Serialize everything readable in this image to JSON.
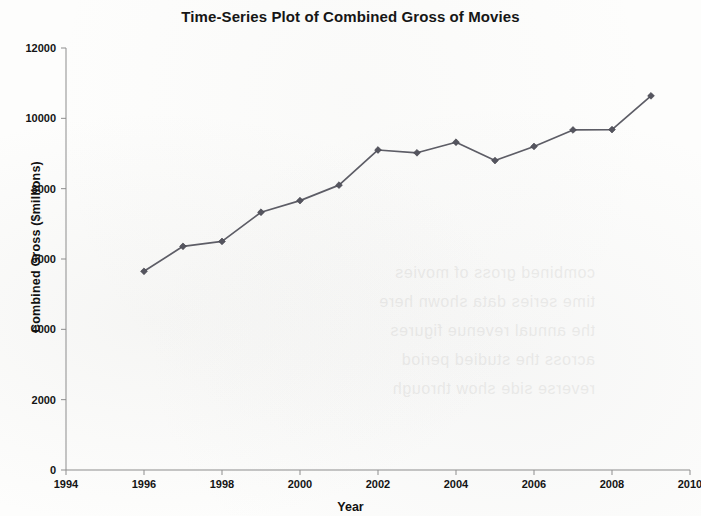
{
  "chart_data": {
    "type": "line",
    "title": "Time-Series Plot of Combined Gross of Movies",
    "xlabel": "Year",
    "ylabel": "Combined Gross ($millions)",
    "xlim": [
      1994,
      2010
    ],
    "ylim": [
      0,
      12000
    ],
    "xticks": [
      1994,
      1996,
      1998,
      2000,
      2002,
      2004,
      2006,
      2008,
      2010
    ],
    "yticks": [
      0,
      2000,
      4000,
      6000,
      8000,
      10000,
      12000
    ],
    "xtick_labels": [
      "1994",
      "1996",
      "1998",
      "2000",
      "2002",
      "2004",
      "2006",
      "2008",
      "2010"
    ],
    "ytick_labels": [
      "0",
      "2000",
      "4000",
      "6000",
      "8000",
      "10000",
      "12000"
    ],
    "grid": false,
    "legend": false,
    "legend_position": "none",
    "marker": "diamond",
    "line_color": "#5d5d66",
    "marker_color": "#55555f",
    "x": [
      1996,
      1997,
      1998,
      1999,
      2000,
      2001,
      2002,
      2003,
      2004,
      2005,
      2006,
      2007,
      2008,
      2009
    ],
    "values": [
      5650,
      6360,
      6500,
      7330,
      7660,
      8100,
      9100,
      9020,
      9320,
      8800,
      9200,
      9670,
      9680,
      10640
    ],
    "series": [
      {
        "name": "Combined Gross",
        "values": [
          5650,
          6360,
          6500,
          7330,
          7660,
          8100,
          9100,
          9020,
          9320,
          8800,
          9200,
          9670,
          9680,
          10640
        ]
      }
    ]
  },
  "artifacts": {
    "bleed_line_1": "combined gross of movies",
    "bleed_line_2": "time series data shown here",
    "bleed_line_3": "the annual revenue figures",
    "bleed_line_4": "across the studied period",
    "bleed_line_5": "reverse side show through"
  }
}
